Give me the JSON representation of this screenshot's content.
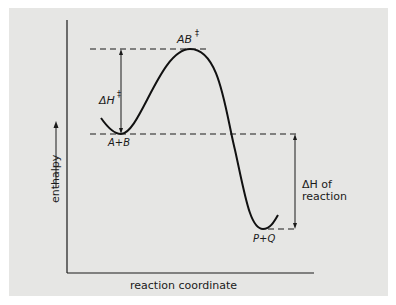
{
  "diagram": {
    "type": "reaction-energy-profile",
    "y_axis_label": "enthalpy",
    "x_axis_label": "reaction coordinate",
    "labels": {
      "transition_state": "AB",
      "transition_state_mark": "‡",
      "reactants": "A+B",
      "products": "P+Q",
      "activation_enthalpy_symbol": "ΔH",
      "activation_enthalpy_mark": "‡",
      "reaction_enthalpy_line1": "ΔH of",
      "reaction_enthalpy_line2": "reaction"
    },
    "colors": {
      "background": "#e6e6e4",
      "ink": "#1a1a1a",
      "page": "#ffffff"
    }
  }
}
